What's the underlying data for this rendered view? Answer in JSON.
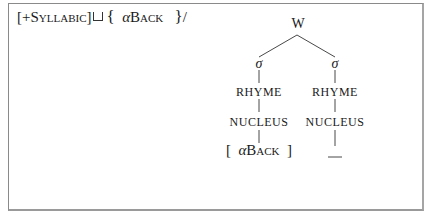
{
  "rule": {
    "open_bracket": "[",
    "feature_sign": "+",
    "feature_name": "Syllabic",
    "close_bracket": "]",
    "join_symbol": "⊔",
    "open_brace": "{",
    "alpha": "α",
    "back_feature": "Back",
    "close_brace": "}",
    "slash": "/"
  },
  "tree": {
    "root": "W",
    "left": {
      "syllable": "σ",
      "rhyme": "RHYME",
      "nucleus": "NUCLEUS",
      "feature_open": "[",
      "feature_alpha": "α",
      "feature_name": "Back",
      "feature_close": "]"
    },
    "right": {
      "syllable": "σ",
      "rhyme": "RHYME",
      "nucleus": "NUCLEUS",
      "target": "__"
    }
  }
}
